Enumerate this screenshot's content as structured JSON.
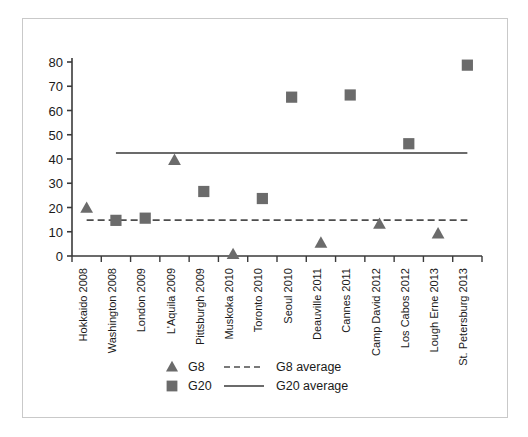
{
  "chart_data": {
    "type": "scatter",
    "title": "",
    "xlabel": "",
    "ylabel": "",
    "ylim": [
      0,
      80
    ],
    "yticks": [
      0,
      10,
      20,
      30,
      40,
      50,
      60,
      70,
      80
    ],
    "grid": false,
    "legend_position": "bottom-center",
    "categories": [
      "Hokkaido 2008",
      "Washington 2008",
      "London 2009",
      "L'Aquila 2009",
      "Pittsburgh 2009",
      "Muskoka 2010",
      "Toronto 2010",
      "Seoul 2010",
      "Deauville 2011",
      "Cannes 2011",
      "Camp David 2012",
      "Los Cabos 2012",
      "Lough Erne 2013",
      "St. Petersburg 2013"
    ],
    "series": [
      {
        "name": "G8",
        "marker": "triangle",
        "color": "#6b6b6b",
        "values": [
          19.8,
          null,
          null,
          39.5,
          null,
          0.7,
          null,
          null,
          5.4,
          null,
          13.2,
          null,
          9.2,
          null
        ]
      },
      {
        "name": "G20",
        "marker": "square",
        "color": "#6b6b6b",
        "values": [
          null,
          14.7,
          15.6,
          null,
          26.6,
          null,
          23.7,
          65.5,
          null,
          66.4,
          null,
          46.3,
          null,
          78.7
        ]
      }
    ],
    "reference_lines": [
      {
        "name": "G8 average",
        "value": 14.8,
        "style": "dashed",
        "color": "#4d4d4d",
        "x_start_category": "Hokkaido 2008",
        "x_end_category": "St. Petersburg 2013"
      },
      {
        "name": "G20 average",
        "value": 42.5,
        "style": "solid",
        "color": "#6b6b6b",
        "x_start_category": "Washington 2008",
        "x_end_category": "St. Petersburg 2013"
      }
    ]
  },
  "legend": {
    "entries": [
      {
        "label": "G8",
        "marker": "triangle"
      },
      {
        "label": "G20",
        "marker": "square"
      },
      {
        "label": "G8 average",
        "marker": "dashed-line"
      },
      {
        "label": "G20 average",
        "marker": "solid-line"
      }
    ]
  },
  "colors": {
    "marker": "#6b6b6b",
    "axis": "#3a3a3a",
    "text": "#1a1a1a",
    "frame": "#c9c9c9"
  }
}
